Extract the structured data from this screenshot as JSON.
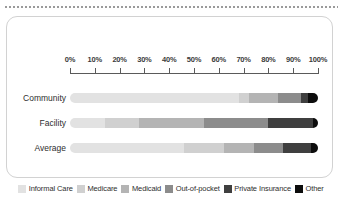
{
  "chart_data": {
    "type": "bar",
    "orientation": "horizontal",
    "stacked": true,
    "normalized": true,
    "title": "",
    "xlabel": "",
    "ylabel": "",
    "xlim": [
      0,
      100
    ],
    "grid": false,
    "legend_position": "bottom",
    "categories": [
      "Community",
      "Facility",
      "Average"
    ],
    "tick_labels": [
      "0%",
      "10%",
      "20%",
      "30%",
      "40%",
      "50%",
      "60%",
      "70%",
      "80%",
      "90%",
      "100%"
    ],
    "tick_values": [
      0,
      10,
      20,
      30,
      40,
      50,
      60,
      70,
      80,
      90,
      100
    ],
    "series": [
      {
        "name": "Informal Care",
        "color": "#e2e2e2",
        "values": [
          68,
          14,
          46
        ]
      },
      {
        "name": "Medicare",
        "color": "#d0d0d0",
        "values": [
          4,
          14,
          16
        ]
      },
      {
        "name": "Medicaid",
        "color": "#b4b4b4",
        "values": [
          12,
          26,
          12
        ]
      },
      {
        "name": "Out-of-pocket",
        "color": "#8c8c8c",
        "values": [
          9,
          26,
          12
        ]
      },
      {
        "name": "Private Insurance",
        "color": "#3f3f3f",
        "values": [
          3,
          18,
          11
        ]
      },
      {
        "name": "Other",
        "color": "#0d0d0d",
        "values": [
          4,
          2,
          3
        ]
      }
    ]
  },
  "legend": {
    "items": [
      {
        "label": "Informal Care",
        "color": "#e2e2e2"
      },
      {
        "label": "Medicare",
        "color": "#d0d0d0"
      },
      {
        "label": "Medicaid",
        "color": "#b4b4b4"
      },
      {
        "label": "Out-of-pocket",
        "color": "#8c8c8c"
      },
      {
        "label": "Private Insurance",
        "color": "#3f3f3f"
      },
      {
        "label": "Other",
        "color": "#0d0d0d"
      }
    ]
  }
}
